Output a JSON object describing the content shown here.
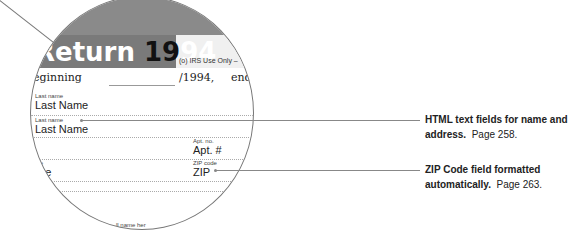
{
  "form": {
    "title_word": "Return",
    "title_year_a": "19",
    "title_year_b": "94",
    "irs_use_only": "(o) IRS Use Only –",
    "beginning_label": "eginning",
    "year_suffix": "/1994,",
    "ending_label": "ending",
    "fields": {
      "last_name_1_label": "Last name",
      "last_name_1_value": "Last Name",
      "last_name_2_label": "Last name",
      "last_name_2_value": "Last Name",
      "apt_label": "Apt. no.",
      "apt_value": "Apt. #",
      "state_label": "tate",
      "state_value": "tate",
      "zip_label": "ZIP code",
      "zip_value": "ZIP"
    },
    "footer_fragment": "ll name her"
  },
  "callouts": [
    {
      "bold": "HTML text fields for name and address.",
      "page": "Page 258."
    },
    {
      "bold": "ZIP Code field formatted automatically.",
      "page": "Page 263."
    }
  ]
}
